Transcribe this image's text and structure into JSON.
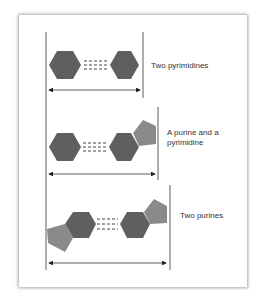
{
  "panels": [
    {
      "label": "Two pyrimidines"
    },
    {
      "label_line1": "A purine and a",
      "label_line2": "pyrimidine"
    },
    {
      "label": "Two purines"
    }
  ],
  "colors": {
    "hexagon": "#5f5f5f",
    "pentagon": "#8a8a8a",
    "line": "#333333"
  }
}
